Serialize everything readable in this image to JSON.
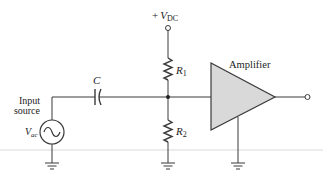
{
  "diagram": {
    "labels": {
      "supply_prefix": "+",
      "supply_symbol": "V",
      "supply_subscript": "DC",
      "r1_symbol": "R",
      "r1_subscript": "1",
      "r2_symbol": "R",
      "r2_subscript": "2",
      "capacitor": "C",
      "amplifier": "Amplifier",
      "input_line1": "Input",
      "input_line2": "source",
      "vac_symbol": "V",
      "vac_subscript": "ac"
    },
    "components": [
      {
        "id": "vdc-terminal",
        "type": "supply-terminal"
      },
      {
        "id": "R1",
        "type": "resistor"
      },
      {
        "id": "R2",
        "type": "resistor"
      },
      {
        "id": "C",
        "type": "capacitor"
      },
      {
        "id": "Vac",
        "type": "ac-source"
      },
      {
        "id": "amplifier",
        "type": "amplifier"
      },
      {
        "id": "output-terminal",
        "type": "terminal"
      },
      {
        "id": "ground-source",
        "type": "ground"
      },
      {
        "id": "ground-divider",
        "type": "ground"
      },
      {
        "id": "ground-amplifier",
        "type": "ground"
      }
    ],
    "colors": {
      "wire": "#3a3a3a",
      "amplifier_fill": "#d9d9d9",
      "text": "#222222",
      "separator": "#e6e6e6"
    }
  }
}
